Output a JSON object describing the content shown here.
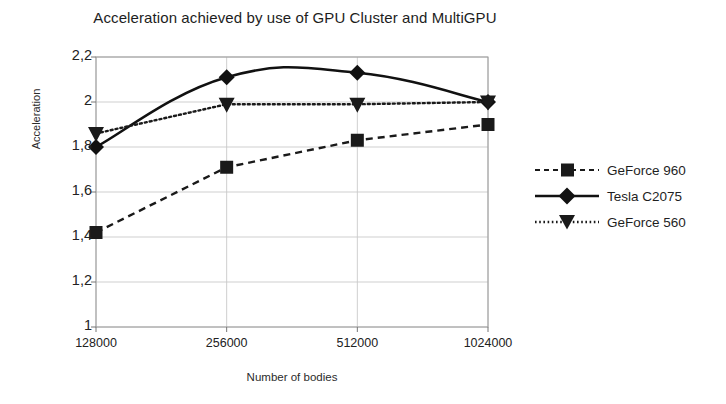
{
  "chart_data": {
    "type": "line",
    "title": "Acceleration achieved by use of GPU Cluster and MultiGPU",
    "xlabel": "Number of bodies",
    "ylabel": "Acceleration",
    "categories": [
      "128000",
      "256000",
      "512000",
      "1024000"
    ],
    "ytick_labels": [
      "1",
      "1,2",
      "1,4",
      "1,6",
      "1,8",
      "2",
      "2,2"
    ],
    "ytick_values": [
      1,
      1.2,
      1.4,
      1.6,
      1.8,
      2,
      2.2
    ],
    "ylim": [
      1,
      2.2
    ],
    "grid": true,
    "legend_position": "right",
    "series": [
      {
        "name": "GeForce 960",
        "values": [
          1.42,
          1.71,
          1.83,
          1.9
        ],
        "line_style": "dashed",
        "marker": "square",
        "color": "#1a1a1a"
      },
      {
        "name": "Tesla C2075",
        "values": [
          1.8,
          2.11,
          2.13,
          2.0
        ],
        "line_style": "solid",
        "marker": "diamond",
        "color": "#111111",
        "smooth": true
      },
      {
        "name": "GeForce 560",
        "values": [
          1.86,
          1.99,
          1.99,
          2.0
        ],
        "line_style": "dotted",
        "marker": "triangle-down",
        "color": "#1a1a1a"
      }
    ]
  },
  "legend": {
    "items": [
      {
        "label": "GeForce 960"
      },
      {
        "label": "Tesla C2075"
      },
      {
        "label": "GeForce 560"
      }
    ]
  }
}
